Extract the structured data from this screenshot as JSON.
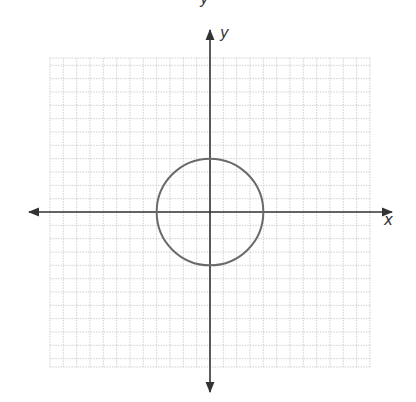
{
  "chart_data": {
    "type": "line",
    "title": "",
    "top_cropped_label": "y",
    "xlabel": "x",
    "ylabel": "y",
    "grid": true,
    "grid_cells_x": 24,
    "grid_cells_y": 23,
    "xlim": [
      -12,
      12
    ],
    "ylim": [
      -11.5,
      11.5
    ],
    "tick_labels": [],
    "series": [
      {
        "name": "circle",
        "shape": "circle",
        "equation": "x^2 + y^2 = 16",
        "center": [
          0,
          0
        ],
        "radius": 4,
        "color": "#666666"
      }
    ]
  },
  "colors": {
    "axis": "#333333",
    "grid": "#bdbdbd",
    "curve": "#6a6a6a"
  }
}
